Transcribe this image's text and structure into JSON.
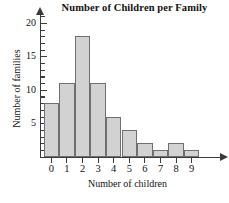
{
  "chart_data": {
    "type": "bar",
    "title": "Number of Children per Family",
    "xlabel": "Number of children",
    "ylabel": "Number of families",
    "categories": [
      "0",
      "1",
      "2",
      "3",
      "4",
      "5",
      "6",
      "7",
      "8",
      "9"
    ],
    "values": [
      8,
      11,
      18,
      11,
      6,
      4,
      2,
      1,
      2,
      1
    ],
    "ylim": [
      0,
      21
    ],
    "xlim": [
      -0.5,
      9.5
    ],
    "y_major_ticks": [
      5,
      10,
      15,
      20
    ],
    "y_major_tick_labels": [
      "5",
      "10",
      "15",
      "20"
    ],
    "y_minor_tick_step": 1,
    "grid": false,
    "legend": null,
    "bar_fill_color": "#d2d2d2",
    "bar_edge_color": "#6f6f6f",
    "axis_color": "#3a3a3a",
    "text_color": "#111111",
    "background_color": "#ffffff"
  }
}
